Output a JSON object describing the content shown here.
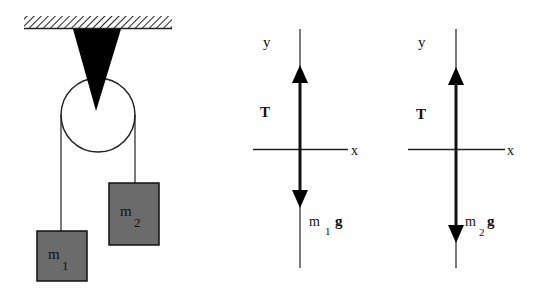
{
  "pulley_system": {
    "mass1_label": "m",
    "mass1_sub": "1",
    "mass2_label": "m",
    "mass2_sub": "2",
    "mass_color": "#6b6b6b"
  },
  "fbd_mass1": {
    "y_axis_label": "y",
    "x_axis_label": "x",
    "tension_label": "T",
    "weight_label_m": "m",
    "weight_label_sub": "1",
    "weight_label_g": "g"
  },
  "fbd_mass2": {
    "y_axis_label": "y",
    "x_axis_label": "x",
    "tension_label": "T",
    "weight_label_m": "m",
    "weight_label_sub": "2",
    "weight_label_g": "g"
  }
}
